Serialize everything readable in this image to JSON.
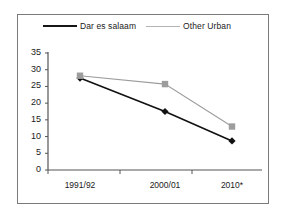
{
  "chart_data": {
    "type": "line",
    "title": "",
    "subtitle": "",
    "xlabel": "",
    "ylabel": "",
    "categories": [
      "1991/92",
      "2000/01",
      "2010*"
    ],
    "series": [
      {
        "name": "Dar es salaam",
        "values": [
          27.5,
          17.5,
          8.7
        ],
        "color": "#111111",
        "marker": "diamond"
      },
      {
        "name": "Other Urban",
        "values": [
          28.2,
          25.7,
          13.0
        ],
        "color": "#9d9d9d",
        "marker": "square"
      }
    ],
    "ylim": [
      0,
      35
    ],
    "ytick_values": [
      0,
      5,
      10,
      15,
      20,
      25,
      30,
      35
    ],
    "ytick_labels": [
      "0",
      "5",
      "10",
      "15",
      "20",
      "25",
      "30",
      "35"
    ],
    "grid": false,
    "legend_position": "top"
  },
  "legend": {
    "entries": [
      {
        "label": "Dar es salaam",
        "marker": "diamond-marker-icon"
      },
      {
        "label": "Other Urban",
        "marker": "square-marker-icon"
      }
    ]
  },
  "axes": {
    "y_labels": [
      "35",
      "30",
      "25",
      "20",
      "15",
      "10",
      "5",
      "0"
    ],
    "x_labels": [
      "1991/92",
      "2000/01",
      "2010*"
    ]
  }
}
